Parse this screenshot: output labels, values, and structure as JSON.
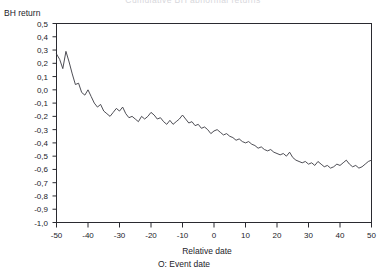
{
  "chart_data": {
    "type": "line",
    "title": "Cumulative BH abnormal returns",
    "title_visible_partial": true,
    "xlabel": "Relative date",
    "ylabel": "BH return",
    "note": "O: Event date",
    "grid": false,
    "legend": false,
    "xlim": [
      -50,
      50
    ],
    "ylim": [
      -1.0,
      0.5
    ],
    "decimal_separator": ",",
    "xticks": [
      -50,
      -40,
      -30,
      -20,
      -10,
      0,
      10,
      20,
      30,
      40,
      50
    ],
    "xtick_labels": [
      "-50",
      "-40",
      "-30",
      "-20",
      "-10",
      "0",
      "10",
      "20",
      "30",
      "40",
      "50"
    ],
    "yticks": [
      0.5,
      0.4,
      0.3,
      0.2,
      0.1,
      0.0,
      -0.1,
      -0.2,
      -0.3,
      -0.4,
      -0.5,
      -0.6,
      -0.7,
      -0.8,
      -0.9,
      -1.0
    ],
    "ytick_labels": [
      "0,5",
      "0,4",
      "0,3",
      "0,2",
      "0,1",
      "0,0",
      "-0,1",
      "-0,2",
      "-0,3",
      "-0,4",
      "-0,5",
      "-0,6",
      "-0,7",
      "-0,8",
      "-0,9",
      "-1,0"
    ],
    "series": [
      {
        "name": "BH return",
        "color": "#3a3a42",
        "x": [
          -50,
          -49,
          -48,
          -47,
          -46,
          -45,
          -44,
          -43,
          -42,
          -41,
          -40,
          -39,
          -38,
          -37,
          -36,
          -35,
          -34,
          -33,
          -32,
          -31,
          -30,
          -29,
          -28,
          -27,
          -26,
          -25,
          -24,
          -23,
          -22,
          -21,
          -20,
          -19,
          -18,
          -17,
          -16,
          -15,
          -14,
          -13,
          -12,
          -11,
          -10,
          -9,
          -8,
          -7,
          -6,
          -5,
          -4,
          -3,
          -2,
          -1,
          0,
          1,
          2,
          3,
          4,
          5,
          6,
          7,
          8,
          9,
          10,
          11,
          12,
          13,
          14,
          15,
          16,
          17,
          18,
          19,
          20,
          21,
          22,
          23,
          24,
          25,
          26,
          27,
          28,
          29,
          30,
          31,
          32,
          33,
          34,
          35,
          36,
          37,
          38,
          39,
          40,
          41,
          42,
          43,
          44,
          45,
          46,
          47,
          48,
          49,
          50
        ],
        "values": [
          0.27,
          0.23,
          0.16,
          0.29,
          0.21,
          0.12,
          0.04,
          0.05,
          -0.02,
          -0.04,
          0.0,
          -0.05,
          -0.1,
          -0.13,
          -0.11,
          -0.16,
          -0.18,
          -0.2,
          -0.17,
          -0.14,
          -0.16,
          -0.13,
          -0.18,
          -0.21,
          -0.2,
          -0.22,
          -0.24,
          -0.2,
          -0.22,
          -0.2,
          -0.17,
          -0.19,
          -0.22,
          -0.21,
          -0.24,
          -0.26,
          -0.23,
          -0.26,
          -0.24,
          -0.22,
          -0.19,
          -0.22,
          -0.25,
          -0.24,
          -0.27,
          -0.26,
          -0.29,
          -0.28,
          -0.3,
          -0.33,
          -0.31,
          -0.3,
          -0.32,
          -0.34,
          -0.33,
          -0.35,
          -0.36,
          -0.38,
          -0.37,
          -0.39,
          -0.4,
          -0.39,
          -0.41,
          -0.42,
          -0.44,
          -0.43,
          -0.45,
          -0.46,
          -0.45,
          -0.47,
          -0.48,
          -0.49,
          -0.48,
          -0.5,
          -0.47,
          -0.51,
          -0.53,
          -0.54,
          -0.55,
          -0.54,
          -0.56,
          -0.55,
          -0.57,
          -0.54,
          -0.56,
          -0.58,
          -0.57,
          -0.59,
          -0.58,
          -0.56,
          -0.57,
          -0.55,
          -0.53,
          -0.56,
          -0.58,
          -0.57,
          -0.59,
          -0.58,
          -0.56,
          -0.54,
          -0.53
        ]
      }
    ]
  }
}
